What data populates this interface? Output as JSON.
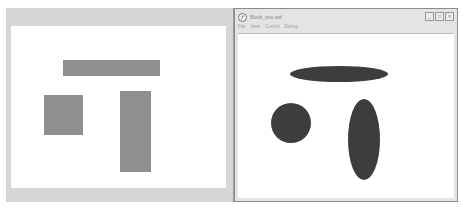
{
  "left_panel": {
    "shapes": [
      {
        "type": "rectangle",
        "name": "horizontal-bar",
        "color": "#8f8f8f"
      },
      {
        "type": "rectangle",
        "name": "square",
        "color": "#8f8f8f"
      },
      {
        "type": "rectangle",
        "name": "vertical-bar",
        "color": "#8f8f8f"
      }
    ]
  },
  "window": {
    "title": "Block_test.swf",
    "icon": "flash-player-icon",
    "buttons": {
      "minimize": "_",
      "maximize": "□",
      "close": "×"
    },
    "menu": [
      "File",
      "View",
      "Control",
      "Debug"
    ],
    "shapes": [
      {
        "type": "ellipse",
        "name": "horizontal-ellipse",
        "color": "#3d3d3d"
      },
      {
        "type": "circle",
        "name": "circle",
        "color": "#3d3d3d"
      },
      {
        "type": "ellipse",
        "name": "vertical-ellipse",
        "color": "#3d3d3d"
      }
    ]
  }
}
